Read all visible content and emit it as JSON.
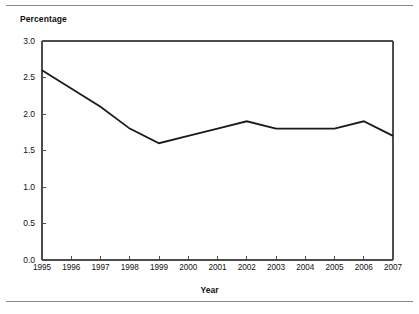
{
  "figure": {
    "background_color": "#ffffff",
    "rule_color": "#8a8a8a",
    "top_rule": "horizontal-rule",
    "bottom_rule": "horizontal-rule"
  },
  "chart_data": {
    "type": "line",
    "title": "",
    "ylabel": "Percentage",
    "xlabel": "Year",
    "categories": [
      "1995",
      "1996",
      "1997",
      "1998",
      "1999",
      "2000",
      "2001",
      "2002",
      "2003",
      "2004",
      "2005",
      "2006",
      "2007"
    ],
    "values": [
      2.6,
      2.35,
      2.1,
      1.8,
      1.6,
      1.7,
      1.8,
      1.9,
      1.8,
      1.8,
      1.8,
      1.9,
      1.7
    ],
    "series": [
      {
        "name": "Percentage",
        "values": [
          2.6,
          2.35,
          2.1,
          1.8,
          1.6,
          1.7,
          1.8,
          1.9,
          1.8,
          1.8,
          1.8,
          1.9,
          1.7
        ],
        "color": "#1a1a1a"
      }
    ],
    "ylim": [
      0.0,
      3.0
    ],
    "xlim": [
      "1995",
      "2007"
    ],
    "ytick_labels": [
      "0.0",
      "0.5",
      "1.0",
      "1.5",
      "2.0",
      "2.5",
      "3.0"
    ],
    "ytick_values": [
      0.0,
      0.5,
      1.0,
      1.5,
      2.0,
      2.5,
      3.0
    ],
    "xtick_labels": [
      "1995",
      "1996",
      "1997",
      "1998",
      "1999",
      "2000",
      "2001",
      "2002",
      "2003",
      "2004",
      "2005",
      "2006",
      "2007"
    ],
    "grid": false,
    "legend": "none",
    "line_color": "#1a1a1a",
    "axis_color": "#4d4d4d"
  }
}
